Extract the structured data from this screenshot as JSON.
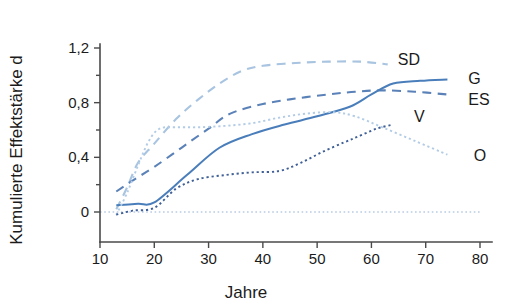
{
  "chart_data": {
    "type": "line",
    "title": "",
    "xlabel": "Jahre",
    "ylabel": "Kumulierte Effektstärke d",
    "xlim": [
      10,
      80
    ],
    "ylim": [
      -0.1,
      1.3
    ],
    "xticks": [
      10,
      20,
      30,
      40,
      50,
      60,
      70,
      80
    ],
    "xticklabels": [
      "10",
      "20",
      "30",
      "40",
      "50",
      "60",
      "70",
      "80"
    ],
    "yticks": [
      0,
      0.4,
      0.8,
      1.2
    ],
    "yticklabels": [
      "0",
      "0,4",
      "0,8",
      "1,2"
    ],
    "yminorticks": [
      0.2,
      0.6,
      1.0
    ],
    "grid": false,
    "legend_position": "inline-right-of-line-ends",
    "zero_reference_line": 0,
    "series": [
      {
        "name": "SD",
        "label": "SD",
        "style": "dashed",
        "color": "#a8c4e0",
        "label_x": 63,
        "label_y": 1.12,
        "x": [
          13,
          15,
          17,
          20,
          24,
          28,
          32,
          36,
          40,
          46,
          52,
          58,
          63
        ],
        "y": [
          0.02,
          0.18,
          0.36,
          0.5,
          0.68,
          0.82,
          0.94,
          1.03,
          1.07,
          1.09,
          1.1,
          1.1,
          1.08
        ]
      },
      {
        "name": "ES",
        "label": "ES",
        "style": "dashed",
        "color": "#5b82b8",
        "label_x": 76,
        "label_y": 0.83,
        "x": [
          13,
          16,
          20,
          25,
          30,
          34,
          40,
          46,
          52,
          57,
          62,
          68,
          74
        ],
        "y": [
          0.15,
          0.23,
          0.33,
          0.47,
          0.61,
          0.72,
          0.79,
          0.83,
          0.86,
          0.88,
          0.89,
          0.88,
          0.86
        ]
      },
      {
        "name": "G",
        "label": "G",
        "style": "solid",
        "color": "#4a7ebb",
        "label_x": 76,
        "label_y": 0.98,
        "x": [
          13,
          17,
          20,
          26,
          32,
          38,
          44,
          50,
          56,
          60,
          64,
          69,
          74
        ],
        "y": [
          0.05,
          0.06,
          0.07,
          0.27,
          0.47,
          0.57,
          0.64,
          0.7,
          0.77,
          0.86,
          0.94,
          0.96,
          0.97
        ]
      },
      {
        "name": "O",
        "label": "O",
        "style": "dotted",
        "color": "#b3cce6",
        "label_x": 77,
        "label_y": 0.42,
        "x": [
          13,
          15,
          17,
          19,
          21,
          24,
          28,
          33,
          38,
          43,
          48,
          53,
          57,
          62,
          68,
          74
        ],
        "y": [
          -0.02,
          0.14,
          0.34,
          0.52,
          0.61,
          0.62,
          0.62,
          0.63,
          0.65,
          0.69,
          0.72,
          0.73,
          0.7,
          0.62,
          0.52,
          0.42
        ]
      },
      {
        "name": "V",
        "label": "V",
        "style": "dotted",
        "color": "#3f5f96",
        "label_x": 66,
        "label_y": 0.7,
        "x": [
          13,
          16,
          20,
          24,
          28,
          33,
          38,
          43,
          47,
          51,
          55,
          58,
          61,
          64
        ],
        "y": [
          -0.02,
          0.01,
          0.03,
          0.17,
          0.24,
          0.27,
          0.29,
          0.3,
          0.36,
          0.44,
          0.51,
          0.56,
          0.61,
          0.64
        ]
      }
    ]
  }
}
